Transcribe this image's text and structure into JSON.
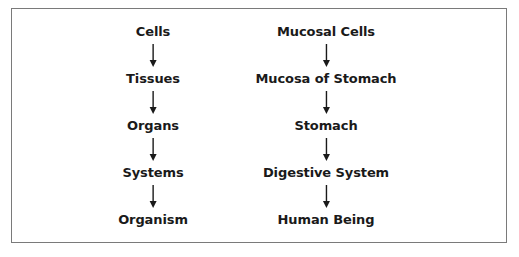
{
  "diagram": {
    "type": "hierarchy-flow",
    "left_column": {
      "nodes": [
        "Cells",
        "Tissues",
        "Organs",
        "Systems",
        "Organism"
      ]
    },
    "right_column": {
      "nodes": [
        "Mucosal Cells",
        "Mucosa of Stomach",
        "Stomach",
        "Digestive System",
        "Human Being"
      ]
    },
    "arrow_icon": "down-arrow-icon",
    "colors": {
      "text": "#1a1a1a",
      "arrow": "#1a1a1a",
      "border": "#7a7a7a",
      "background": "#ffffff"
    }
  }
}
